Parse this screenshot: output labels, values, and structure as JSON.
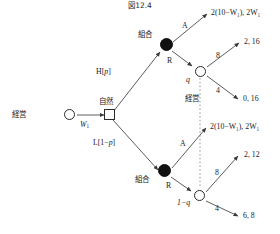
{
  "figure": {
    "title": "図12.4",
    "type": "extensive-form-game-tree"
  },
  "nodes": {
    "management_root": {
      "label": "経営",
      "shape": "open-circle"
    },
    "nature": {
      "label": "自然",
      "shape": "square"
    },
    "union_high": {
      "label": "組合",
      "shape": "filled-circle"
    },
    "union_low": {
      "label": "組合",
      "shape": "filled-circle"
    },
    "management_high": {
      "label": "q",
      "shape": "open-circle"
    },
    "management_low": {
      "label": "1−q",
      "shape": "open-circle"
    },
    "info_set": {
      "label": "経営"
    }
  },
  "edges": {
    "root_to_nature": {
      "label": "W₁"
    },
    "nature_high": {
      "label": "H[p]"
    },
    "nature_low": {
      "label": "L[1−p]"
    },
    "union_high_accept": {
      "label": "A"
    },
    "union_high_reject": {
      "label": "R"
    },
    "union_low_accept": {
      "label": "A"
    },
    "union_low_reject": {
      "label": "R"
    },
    "mgmt_high_up": {
      "label": "8"
    },
    "mgmt_high_down": {
      "label": "4"
    },
    "mgmt_low_up": {
      "label": "8"
    },
    "mgmt_low_down": {
      "label": "4"
    }
  },
  "payoffs": {
    "high_accept": "2(10−W₁), 2W₁",
    "high_reject_up": "2, 16",
    "high_reject_down": "0, 16",
    "low_accept": "2(10−W₁), 2W₁",
    "low_reject_up": "2, 12",
    "low_reject_down": "6, 8"
  },
  "colors": {
    "stroke": "#4a4a4a",
    "node_fill": "#111111",
    "text": "#1a1a1a",
    "background": "#ffffff"
  }
}
